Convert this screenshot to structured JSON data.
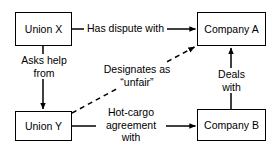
{
  "diagram": {
    "background_color": "#ffffff",
    "line_color": "#000000",
    "nodes": [
      {
        "id": "union-x",
        "label": "Union X"
      },
      {
        "id": "company-a",
        "label": "Company A"
      },
      {
        "id": "union-y",
        "label": "Union Y"
      },
      {
        "id": "company-b",
        "label": "Company B"
      }
    ],
    "edges": [
      {
        "id": "has-dispute-with",
        "from": "Union X",
        "to": "Company A",
        "label": "Has dispute with",
        "style": "solid",
        "direction": "right"
      },
      {
        "id": "asks-help-from",
        "from": "Union X",
        "to": "Union Y",
        "label_line_1": "Asks help",
        "label_line_2": "from",
        "style": "solid",
        "direction": "down"
      },
      {
        "id": "designates-as-unfair",
        "from": "Union Y",
        "to": "Company A",
        "label_line_1": "Designates as",
        "label_line_2": "“unfair”",
        "style": "dashed",
        "direction": "up-right"
      },
      {
        "id": "hot-cargo-agreement-with",
        "from": "Union Y",
        "to": "Company B",
        "label_line_1": "Hot-cargo",
        "label_line_2": "agreement",
        "label_line_3": "with",
        "style": "solid",
        "direction": "right"
      },
      {
        "id": "deals-with",
        "from": "Company B",
        "to": "Company A",
        "label_line_1": "Deals",
        "label_line_2": "with",
        "style": "solid",
        "direction": "up"
      }
    ]
  }
}
